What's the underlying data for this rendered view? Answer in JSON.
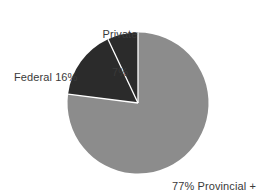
{
  "chart_data": {
    "type": "pie",
    "title": "",
    "subtitle": "",
    "xlabel": "",
    "ylabel": "",
    "grid": false,
    "legend_position": "none",
    "categories": [
      "Provincial + Territorial",
      "Federal",
      "Private"
    ],
    "values": [
      77,
      16,
      7
    ],
    "unit": "%",
    "start_angle_deg": 0,
    "direction": "clockwise",
    "slices": [
      {
        "name": "Provincial + Territorial",
        "value": 77,
        "color": "#8c8c8c",
        "start_deg": 0,
        "end_deg": 277.2,
        "label_lines": [
          "77% Provincial +",
          "Territorial"
        ],
        "label_position": "bottom-right"
      },
      {
        "name": "Federal",
        "value": 16,
        "color": "#2b2b2b",
        "start_deg": 277.2,
        "end_deg": 334.8,
        "label_lines": [
          "Federal 16%"
        ],
        "label_position": "left"
      },
      {
        "name": "Private",
        "value": 7,
        "color": "#2b2b2b",
        "start_deg": 334.8,
        "end_deg": 360,
        "label_lines": [
          "Private",
          "7%"
        ],
        "label_position": "top"
      }
    ],
    "annotations": []
  },
  "labels": {
    "private": {
      "line1": "Private",
      "line2": "7%"
    },
    "federal": {
      "line1": "Federal 16%"
    },
    "provincial": {
      "line1": "77% Provincial +",
      "line2": "Territorial"
    }
  },
  "colors": {
    "background": "#ffffff",
    "slice_light": "#8c8c8c",
    "slice_dark": "#2b2b2b",
    "divider": "#ffffff",
    "text": "#3a3a3a"
  },
  "geometry": {
    "center_x": 138,
    "center_y": 103,
    "radius": 70.5
  }
}
